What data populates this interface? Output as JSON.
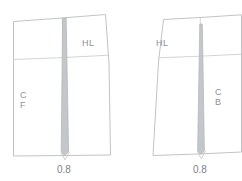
{
  "diagram": {
    "colors": {
      "outline": "#b9bcc0",
      "construction_line": "#c6c9cd",
      "dart_fill": "#c3c6ca",
      "dart_outline": "#b0b3b7",
      "label": "#8d9196",
      "dimension": "#7e8388",
      "background": "#ffffff"
    },
    "panels": [
      {
        "id": "front-panel",
        "name": "front",
        "grain_label": "C\nF",
        "grain_label_lines": [
          "C",
          "F"
        ],
        "hip_line_label": "HL",
        "dart_dimension": "0.8"
      },
      {
        "id": "back-panel",
        "name": "back",
        "grain_label_lines": [
          "C",
          "B"
        ],
        "hip_line_label": "HL",
        "dart_dimension": "0.8"
      }
    ],
    "labels": {
      "front_center_top": "C",
      "front_center_bottom": "F",
      "back_center_top": "C",
      "back_center_bottom": "B",
      "front_hip_line": "HL",
      "back_hip_line": "HL",
      "front_dart_value": "0.8",
      "back_dart_value": "0.8"
    }
  }
}
